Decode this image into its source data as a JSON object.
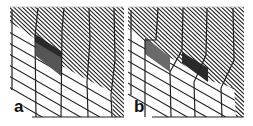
{
  "figure": {
    "panels": [
      {
        "id": "a",
        "label": "a",
        "shaded_regions": 1
      },
      {
        "id": "b",
        "label": "b",
        "shaded_regions": 2
      }
    ],
    "colors": {
      "line": "#222222",
      "background": "#ffffff",
      "shade_dark": "#2a2a2a",
      "shade_mid": "#555555",
      "shade_light": "#6a6a6a"
    }
  }
}
